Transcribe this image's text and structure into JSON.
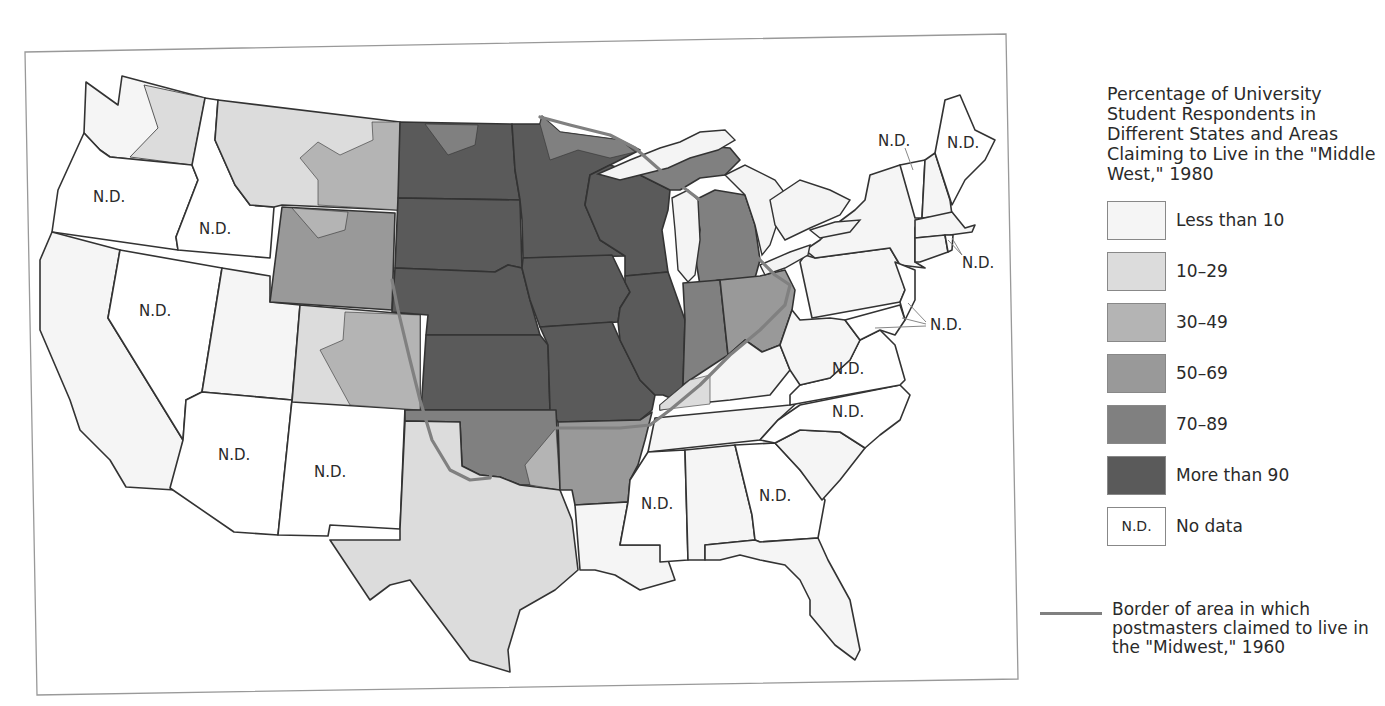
{
  "legend": {
    "title": "Percentage of University Student Respondents in Different States and Areas Claiming to Live in the \"Middle West,\" 1980",
    "items": [
      {
        "label": "Less than 10",
        "color": "#f5f5f5",
        "swatch_text": ""
      },
      {
        "label": "10–29",
        "color": "#dcdcdc",
        "swatch_text": ""
      },
      {
        "label": "30–49",
        "color": "#b4b4b4",
        "swatch_text": ""
      },
      {
        "label": "50–69",
        "color": "#999999",
        "swatch_text": ""
      },
      {
        "label": "70–89",
        "color": "#808080",
        "swatch_text": ""
      },
      {
        "label": "More than 90",
        "color": "#5a5a5a",
        "swatch_text": ""
      },
      {
        "label": "No data",
        "color": "#ffffff",
        "swatch_text": "N.D."
      }
    ],
    "border_line": {
      "label": "Border of area in which postmasters claimed to live in the \"Midwest,\" 1960",
      "color": "#808080"
    }
  },
  "map": {
    "nd_text": "N.D.",
    "states": {
      "WA": "10-29 / <10",
      "OR": "N.D.",
      "CA": "<10",
      "ID": "N.D.",
      "NV": "N.D.",
      "MT": "10-29 / 30-49",
      "WY": "50-69 / 30-49",
      "UT": "<10",
      "CO": "10-29 / 30-49",
      "AZ": "N.D.",
      "NM": "N.D.",
      "ND": "More than 90",
      "SD": "More than 90",
      "NE": "More than 90",
      "KS": "More than 90",
      "OK": "70-89 / 50-69",
      "TX": "10-29",
      "MN": "More than 90",
      "IA": "More than 90",
      "MO": "More than 90",
      "AR": "50-69",
      "LA": "<10",
      "WI": "More than 90",
      "IL": "More than 90",
      "MI": "70-89",
      "IN": "70-89",
      "OH": "50-69",
      "KY": "<10 / 10-29",
      "TN": "<10",
      "MS": "N.D.",
      "AL": "<10",
      "GA": "N.D.",
      "FL": "<10",
      "SC": "<10",
      "NC": "N.D.",
      "VA": "N.D.",
      "WV": "<10",
      "PA": "<10",
      "NY": "<10",
      "VT": "N.D.",
      "NH": "<10",
      "ME": "N.D.",
      "MA": "<10",
      "CT": "<10",
      "RI": "N.D.",
      "NJ": "N.D.",
      "DE": "N.D.",
      "MD": "N.D."
    }
  }
}
